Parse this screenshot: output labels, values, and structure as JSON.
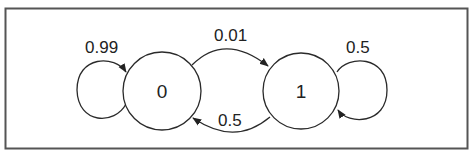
{
  "diagram": {
    "type": "markov-chain",
    "colors": {
      "stroke": "#2a2a2a",
      "text": "#222222",
      "background": "#ffffff",
      "border": "#555555"
    },
    "nodes": [
      {
        "id": "0",
        "label": "0"
      },
      {
        "id": "1",
        "label": "1"
      }
    ],
    "edges": [
      {
        "from": "0",
        "to": "0",
        "label": "0.99"
      },
      {
        "from": "0",
        "to": "1",
        "label": "0.01"
      },
      {
        "from": "1",
        "to": "0",
        "label": "0.5"
      },
      {
        "from": "1",
        "to": "1",
        "label": "0.5"
      }
    ]
  }
}
